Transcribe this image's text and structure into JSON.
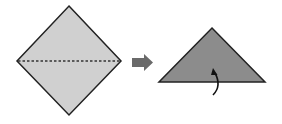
{
  "diagram": {
    "steps": [
      {
        "shape": "diamond",
        "fill": "#d0d0d0",
        "fold_line": "dashed horizontal"
      },
      {
        "shape": "triangle",
        "fill": "#8c8c8c",
        "annotation": "curved fold arrow"
      }
    ],
    "colors": {
      "stroke": "#222222",
      "paper_front": "#d0d0d0",
      "paper_back": "#8c8c8c",
      "arrow": "#6a6a6a"
    }
  }
}
